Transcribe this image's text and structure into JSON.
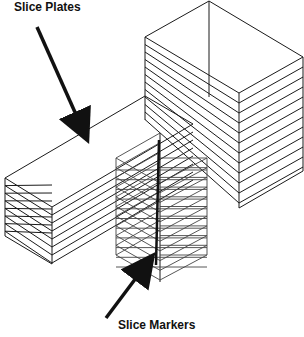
{
  "diagram": {
    "labels": {
      "slice_plates": "Slice Plates",
      "slice_markers": "Slice Markers"
    },
    "colors": {
      "line": "#1a1a1a",
      "background": "#ffffff"
    },
    "elements": [
      {
        "name": "tall-block",
        "description": "tall rectangular block sliced into horizontal plates"
      },
      {
        "name": "long-bar",
        "description": "horizontal bar extending from tall block, sliced lengthwise into plates"
      },
      {
        "name": "marker-column",
        "description": "vertical column of stacked slice markers (cross-hatched diamonds)"
      },
      {
        "name": "arrow-slice-plates",
        "points_to": "long-bar"
      },
      {
        "name": "arrow-slice-markers",
        "points_to": "marker-column"
      }
    ]
  }
}
